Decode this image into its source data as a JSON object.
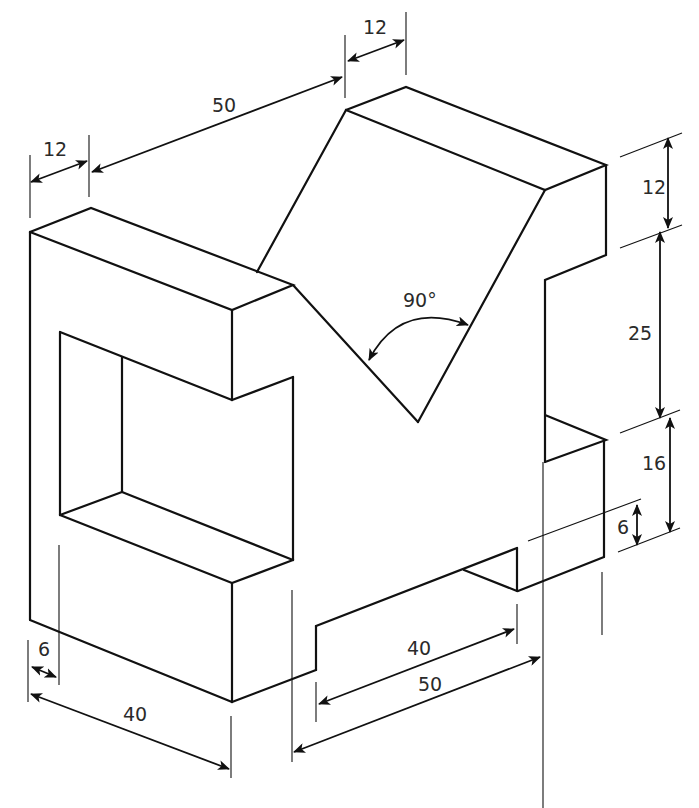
{
  "figure": {
    "type": "isometric-drawing",
    "line_color": "#111111",
    "background": "#ffffff"
  },
  "dimensions": {
    "top_left_width": "12",
    "top_span": "50",
    "top_right_width": "12",
    "right_top_height": "12",
    "right_middle_height": "25",
    "right_lower_height": "16",
    "slot_depth": "6",
    "v_angle": "90°",
    "left_offset": "6",
    "front_depth": "40",
    "slot_width": "40",
    "base_length": "50"
  }
}
